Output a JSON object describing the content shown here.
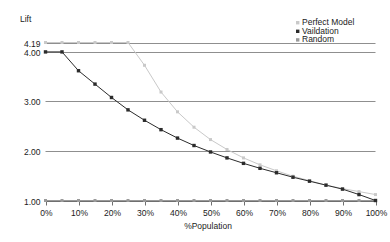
{
  "chart_data": {
    "type": "line",
    "title": "",
    "ylabel": "Lift",
    "xlabel": "%Population",
    "xlim": [
      0,
      100
    ],
    "ylim": [
      1.0,
      4.19
    ],
    "grid": true,
    "grid_axis": "y",
    "legend_position": "top-right",
    "x_ticks": [
      "0%",
      "10%",
      "20%",
      "30%",
      "40%",
      "50%",
      "60%",
      "70%",
      "80%",
      "90%",
      "100%"
    ],
    "x_tick_values": [
      0,
      10,
      20,
      30,
      40,
      50,
      60,
      70,
      80,
      90,
      100
    ],
    "y_ticks": [
      "4.19",
      "4.00",
      "3.00",
      "2.00",
      "1.00"
    ],
    "y_tick_values": [
      4.19,
      4.0,
      3.0,
      2.0,
      1.0
    ],
    "x": [
      0,
      5,
      10,
      15,
      20,
      25,
      30,
      35,
      40,
      45,
      50,
      55,
      60,
      65,
      70,
      75,
      80,
      85,
      90,
      95,
      100
    ],
    "series": [
      {
        "name": "Perfect Model",
        "color": "#c9c9c9",
        "marker": "square",
        "values": [
          4.19,
          4.19,
          4.19,
          4.19,
          4.19,
          4.19,
          3.73,
          3.19,
          2.79,
          2.48,
          2.23,
          2.03,
          1.86,
          1.72,
          1.6,
          1.49,
          1.4,
          1.31,
          1.24,
          1.18,
          1.12
        ]
      },
      {
        "name": "Vaildation",
        "color": "#2b2b2b",
        "marker": "square",
        "values": [
          4.0,
          4.0,
          3.62,
          3.35,
          3.08,
          2.83,
          2.62,
          2.43,
          2.26,
          2.11,
          1.98,
          1.86,
          1.75,
          1.65,
          1.56,
          1.47,
          1.39,
          1.31,
          1.23,
          1.12,
          1.0
        ]
      },
      {
        "name": "Random",
        "color": "#9a9a9a",
        "marker": "square",
        "values": [
          1.0,
          1.0,
          1.0,
          1.0,
          1.0,
          1.0,
          1.0,
          1.0,
          1.0,
          1.0,
          1.0,
          1.0,
          1.0,
          1.0,
          1.0,
          1.0,
          1.0,
          1.0,
          1.0,
          1.0,
          1.0
        ]
      }
    ],
    "legend": [
      {
        "label": "Perfect Model",
        "color": "#c9c9c9"
      },
      {
        "label": "Vaildation",
        "color": "#2b2b2b"
      },
      {
        "label": "Random",
        "color": "#9a9a9a"
      }
    ],
    "colors": {
      "gridline": "#8f8f8f",
      "axis": "#6f6f6f",
      "background": "#ffffff",
      "text": "#1b1b1b"
    }
  }
}
